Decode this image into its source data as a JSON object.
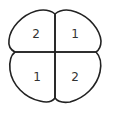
{
  "diagram": {
    "type": "four-region map",
    "regions": [
      {
        "position": "top-left",
        "label": "2"
      },
      {
        "position": "top-right",
        "label": "1"
      },
      {
        "position": "bottom-left",
        "label": "1"
      },
      {
        "position": "bottom-right",
        "label": "2"
      }
    ],
    "stroke_color": "#222222",
    "background": "#ffffff"
  }
}
